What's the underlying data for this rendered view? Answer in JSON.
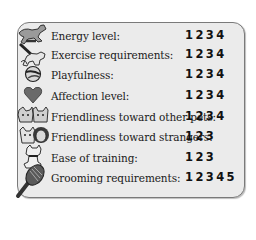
{
  "rows": [
    {
      "icon": "running-dog-icon",
      "label": "Energy level:",
      "rating": "1234"
    },
    {
      "icon": "dog-on-leash-icon",
      "label": "Exercise requirements:",
      "rating": "1234"
    },
    {
      "icon": "ball-icon",
      "label": "Playfulness:",
      "rating": "1234"
    },
    {
      "icon": "heart-icon",
      "label": "Affection level:",
      "rating": "1234"
    },
    {
      "icon": "dog-and-cat-icon",
      "label": "Friendliness toward other pets:",
      "rating": "1234"
    },
    {
      "icon": "dog-and-person-icon",
      "label": "Friendliness toward strangers:",
      "rating": "123"
    },
    {
      "icon": "sitting-dog-icon",
      "label": "Ease of training:",
      "rating": "123"
    },
    {
      "icon": "brush-icon",
      "label": "Grooming requirements:",
      "rating": "12345"
    }
  ],
  "colors": {
    "panel_bg": "#ebebeb",
    "border": "#7a7a7a",
    "heart": "#6a6a6a"
  }
}
